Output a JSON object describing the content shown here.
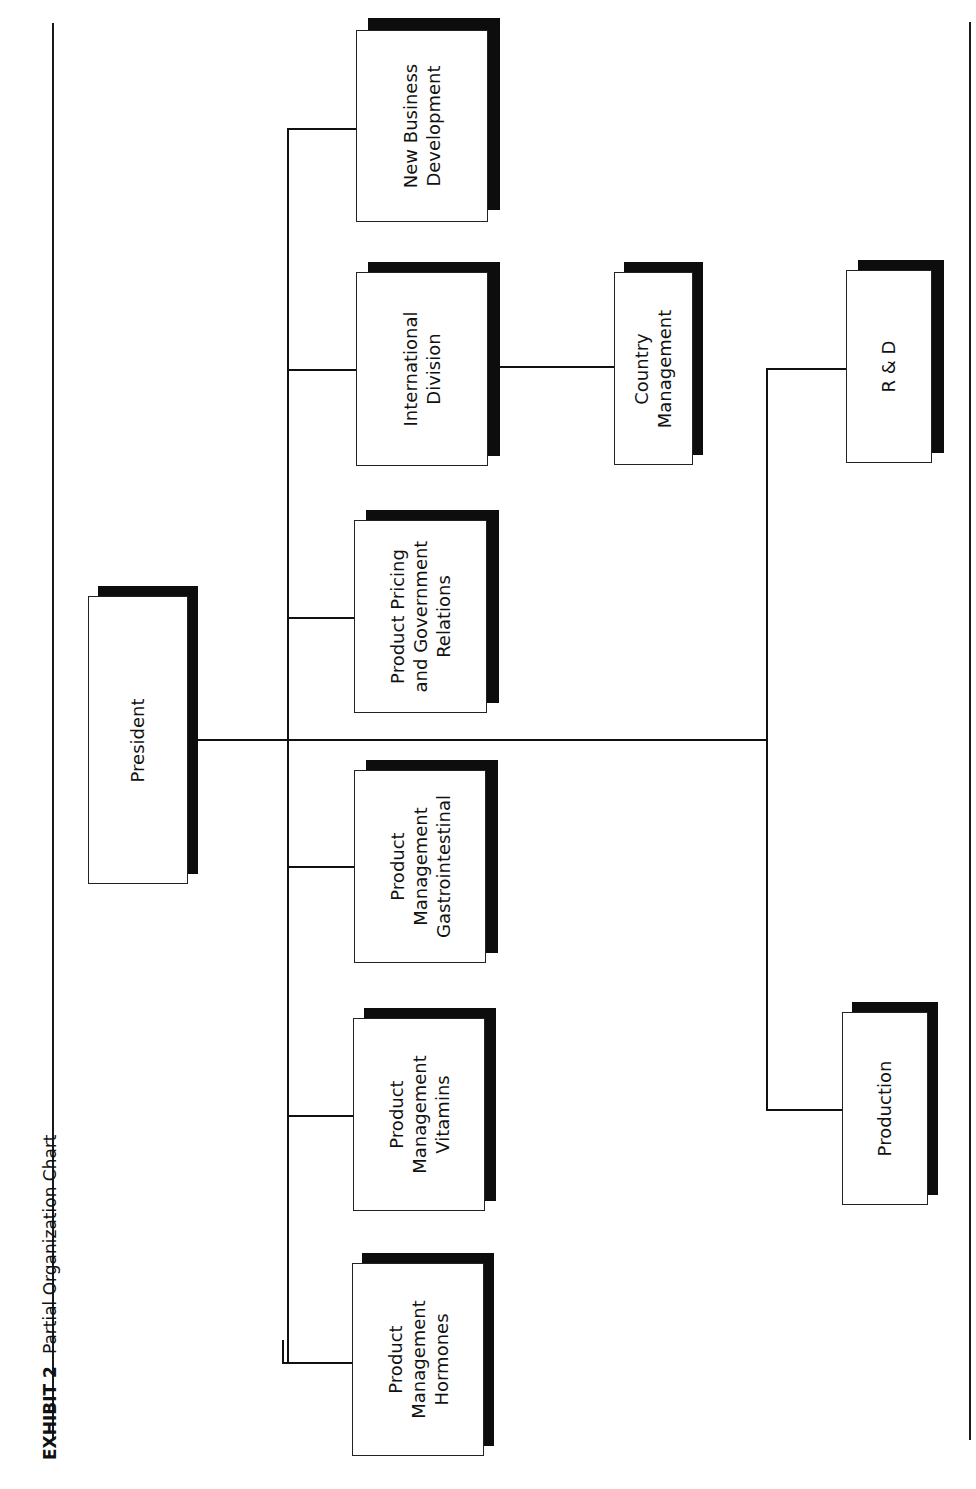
{
  "header": {
    "exhibit": "EXHIBIT 2",
    "title": "Partial Organization Chart"
  },
  "colors": {
    "line": "#111111",
    "shadow": "#0d0d0d",
    "box_fill": "#ffffff"
  },
  "nodes": {
    "president": {
      "lines": [
        "President"
      ],
      "x": 88,
      "y": 596,
      "w": 100,
      "h": 288
    },
    "new_business_development": {
      "lines": [
        "New Business",
        "Development"
      ],
      "x": 356,
      "y": 30,
      "w": 132,
      "h": 192
    },
    "international_division": {
      "lines": [
        "International",
        "Division"
      ],
      "x": 356,
      "y": 272,
      "w": 132,
      "h": 194
    },
    "country_management": {
      "lines": [
        "Country",
        "Management"
      ],
      "x": 614,
      "y": 272,
      "w": 79,
      "h": 193
    },
    "product_pricing": {
      "lines": [
        "Product Pricing",
        "and Government",
        "Relations"
      ],
      "x": 354,
      "y": 520,
      "w": 133,
      "h": 193
    },
    "pm_gastrointestinal": {
      "lines": [
        "Product",
        "Management",
        "Gastrointestinal"
      ],
      "x": 354,
      "y": 770,
      "w": 132,
      "h": 193
    },
    "pm_vitamins": {
      "lines": [
        "Product",
        "Management",
        "Vitamins"
      ],
      "x": 353,
      "y": 1018,
      "w": 132,
      "h": 193
    },
    "pm_hormones": {
      "lines": [
        "Product",
        "Management",
        "Hormones"
      ],
      "x": 352,
      "y": 1263,
      "w": 132,
      "h": 193
    },
    "r_and_d": {
      "lines": [
        "R & D"
      ],
      "x": 846,
      "y": 270,
      "w": 86,
      "h": 193
    },
    "production": {
      "lines": [
        "Production"
      ],
      "x": 842,
      "y": 1012,
      "w": 86,
      "h": 193
    }
  },
  "edges": [
    {
      "from": "president",
      "to": "new_business_development"
    },
    {
      "from": "president",
      "to": "international_division"
    },
    {
      "from": "international_division",
      "to": "country_management"
    },
    {
      "from": "president",
      "to": "product_pricing"
    },
    {
      "from": "president",
      "to": "pm_gastrointestinal"
    },
    {
      "from": "president",
      "to": "pm_vitamins"
    },
    {
      "from": "president",
      "to": "pm_hormones"
    },
    {
      "from": "president",
      "to": "r_and_d"
    },
    {
      "from": "president",
      "to": "production"
    }
  ]
}
